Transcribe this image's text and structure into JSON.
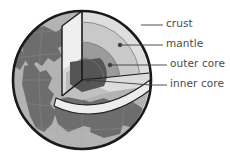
{
  "diagram": {
    "labels": [
      {
        "id": "crust",
        "text": "crust",
        "x": 166,
        "y": 21
      },
      {
        "id": "mantle",
        "text": "mantle",
        "x": 166,
        "y": 41
      },
      {
        "id": "outer-core",
        "text": "outer core",
        "x": 170,
        "y": 61
      },
      {
        "id": "inner-core",
        "text": "inner core",
        "x": 170,
        "y": 81
      }
    ],
    "leaders": [
      {
        "id": "crust-leader",
        "x1": 141,
        "y1": 25,
        "x2": 163,
        "y2": 25,
        "dot": false
      },
      {
        "id": "mantle-leader",
        "x1": 120,
        "y1": 45,
        "x2": 163,
        "y2": 45,
        "dot": true,
        "dotx": 120,
        "doty": 45
      },
      {
        "id": "outer-core-leader",
        "x1": 110,
        "y1": 65,
        "x2": 167,
        "y2": 65,
        "dot": true,
        "dotx": 110,
        "doty": 65
      },
      {
        "id": "inner-core-leader",
        "x1": 88,
        "y1": 80,
        "x2": 167,
        "y2": 85,
        "dot": true,
        "dotx": 88,
        "doty": 80
      }
    ],
    "colors": {
      "ocean": "#b3b3b3",
      "land": "#6e6e6e",
      "outline": "#1a1a1a",
      "crust_band": "#d9d9d9",
      "mantle_band": "#c4c4c4",
      "outer_core_band": "#9a9a9a",
      "inner_core": "#5a5a5a",
      "cut_face_light": "#efefef",
      "cut_face_mid": "#d2d2d2",
      "cut_face_shadow": "#8d8d8d",
      "label_text": "#4a4a4a",
      "leader_line": "#3c3c3c",
      "grid": "#a0a0a0",
      "background": "#ffffff"
    },
    "geometry": {
      "sphere_cx": 82,
      "sphere_cy": 80,
      "sphere_r": 70
    }
  }
}
